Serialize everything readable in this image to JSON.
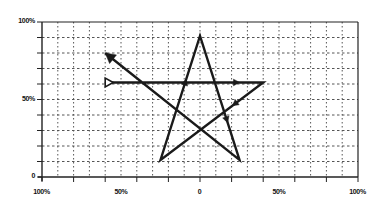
{
  "diagram": {
    "type": "star-path-on-grid",
    "plot_area": {
      "left": 42,
      "top": 22,
      "right": 358,
      "bottom": 177
    },
    "grid": {
      "columns": 20,
      "rows": 10,
      "style": "dotted"
    },
    "colors": {
      "line": "#1a1a1a",
      "grid": "#555555",
      "axis": "#222222",
      "background": "#ffffff"
    },
    "y_axis": {
      "labels": [
        {
          "text": "100%",
          "value": 100
        },
        {
          "text": "50%",
          "value": 50
        },
        {
          "text": "0",
          "value": 0
        }
      ]
    },
    "x_axis": {
      "labels": [
        {
          "text": "100%",
          "value": -100
        },
        {
          "text": "50%",
          "value": -50
        },
        {
          "text": "0",
          "value": 0
        },
        {
          "text": "50%",
          "value": 50
        },
        {
          "text": "100%",
          "value": 100
        }
      ]
    },
    "path": {
      "start_marker": "hollow-triangle",
      "end_marker": "filled-arrowhead",
      "points": [
        {
          "name": "start",
          "x": -60,
          "y": 61
        },
        {
          "name": "right-vertex",
          "x": 40,
          "y": 61
        },
        {
          "name": "bottom-left-vertex",
          "x": -25,
          "y": 11
        },
        {
          "name": "top-vertex",
          "x": 0,
          "y": 91
        },
        {
          "name": "bottom-right-vertex",
          "x": 25,
          "y": 11
        },
        {
          "name": "end",
          "x": -60,
          "y": 80
        }
      ],
      "direction_arrows": [
        {
          "segment": 0,
          "at": 0.85
        },
        {
          "segment": 1,
          "at": 0.3
        },
        {
          "segment": 2,
          "at": 0.65
        },
        {
          "segment": 3,
          "at": 0.7
        }
      ]
    }
  }
}
